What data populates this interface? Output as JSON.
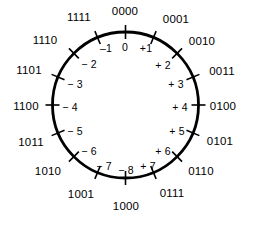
{
  "diagram": {
    "background_color": "#ffffff",
    "stroke_color": "#000000",
    "text_color": "#000000",
    "circle": {
      "center_x": 125.5,
      "center_y": 105,
      "radius": 73,
      "stroke_width": 2.8
    },
    "tick": {
      "inner_length": 7,
      "outer_length": 7,
      "stroke_width": 1.6
    }
  },
  "chart_data": {
    "type": "pie",
    "xlabel": "",
    "ylabel": "",
    "legend": [],
    "categories": [
      "0000",
      "0001",
      "0010",
      "0011",
      "0100",
      "0101",
      "0110",
      "0111",
      "1000",
      "1001",
      "1010",
      "1011",
      "1100",
      "1101",
      "1110",
      "1111"
    ],
    "values": [
      0,
      1,
      2,
      3,
      4,
      5,
      6,
      7,
      -8,
      -7,
      -6,
      -5,
      -4,
      -3,
      -2,
      -1
    ],
    "points": [
      {
        "binary": "0000",
        "decimal": "0",
        "angle_deg": 0,
        "outer_x": 125,
        "outer_y": 12,
        "inner_x": 125,
        "inner_y": 47
      },
      {
        "binary": "0001",
        "decimal": "+1",
        "angle_deg": 22.5,
        "outer_x": 176,
        "outer_y": 20,
        "inner_x": 146,
        "inner_y": 48
      },
      {
        "binary": "0010",
        "decimal": "+ 2",
        "angle_deg": 45,
        "outer_x": 202,
        "outer_y": 42,
        "inner_x": 163,
        "inner_y": 65
      },
      {
        "binary": "0011",
        "decimal": "+ 3",
        "angle_deg": 67.5,
        "outer_x": 222,
        "outer_y": 72,
        "inner_x": 176,
        "inner_y": 84
      },
      {
        "binary": "0100",
        "decimal": "+ 4",
        "angle_deg": 90,
        "outer_x": 223,
        "outer_y": 107,
        "inner_x": 180,
        "inner_y": 107
      },
      {
        "binary": "0101",
        "decimal": "+ 5",
        "angle_deg": 112.5,
        "outer_x": 220,
        "outer_y": 142,
        "inner_x": 177,
        "inner_y": 131
      },
      {
        "binary": "0110",
        "decimal": "+ 6",
        "angle_deg": 135,
        "outer_x": 201,
        "outer_y": 172,
        "inner_x": 163,
        "inner_y": 151
      },
      {
        "binary": "0111",
        "decimal": "+ 7",
        "angle_deg": 157.5,
        "outer_x": 172,
        "outer_y": 194,
        "inner_x": 148,
        "inner_y": 166
      },
      {
        "binary": "1000",
        "decimal": "− 8",
        "angle_deg": 180,
        "outer_x": 126,
        "outer_y": 207,
        "inner_x": 126,
        "inner_y": 170
      },
      {
        "binary": "1001",
        "decimal": "− 7",
        "angle_deg": 202.5,
        "outer_x": 81,
        "outer_y": 195,
        "inner_x": 104,
        "inner_y": 166
      },
      {
        "binary": "1010",
        "decimal": "− 6",
        "angle_deg": 225,
        "outer_x": 48,
        "outer_y": 172,
        "inner_x": 89,
        "inner_y": 151
      },
      {
        "binary": "1011",
        "decimal": "− 5",
        "angle_deg": 247.5,
        "outer_x": 31,
        "outer_y": 143,
        "inner_x": 75,
        "inner_y": 131
      },
      {
        "binary": "1100",
        "decimal": "− 4",
        "angle_deg": 270,
        "outer_x": 26,
        "outer_y": 107,
        "inner_x": 70,
        "inner_y": 107
      },
      {
        "binary": "1101",
        "decimal": "− 3",
        "angle_deg": 292.5,
        "outer_x": 29,
        "outer_y": 71,
        "inner_x": 75,
        "inner_y": 84
      },
      {
        "binary": "1110",
        "decimal": "− 2",
        "angle_deg": 315,
        "outer_x": 45,
        "outer_y": 41,
        "inner_x": 89,
        "inner_y": 64
      },
      {
        "binary": "1111",
        "decimal": "–1",
        "angle_deg": 337.5,
        "outer_x": 79,
        "outer_y": 18,
        "inner_x": 106,
        "inner_y": 48
      }
    ]
  }
}
